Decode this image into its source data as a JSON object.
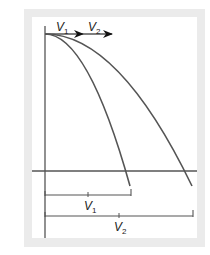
{
  "diagram": {
    "colors": {
      "frame": "#ebebeb",
      "background": "#ffffff",
      "line": "#555555",
      "text": "#222222"
    },
    "velocity_labels": [
      {
        "symbol": "V",
        "subscript": "1"
      },
      {
        "symbol": "V",
        "subscript": "2"
      }
    ],
    "range_labels": [
      {
        "symbol": "V",
        "subscript": "1"
      },
      {
        "symbol": "V",
        "subscript": "2"
      }
    ],
    "origin": {
      "x": 45,
      "y": 34
    },
    "ground_y": 171,
    "trajectories": [
      {
        "name": "trajectory-v1",
        "end_x": 130,
        "end_y": 186
      },
      {
        "name": "trajectory-v2",
        "end_x": 192,
        "end_y": 186
      }
    ]
  }
}
